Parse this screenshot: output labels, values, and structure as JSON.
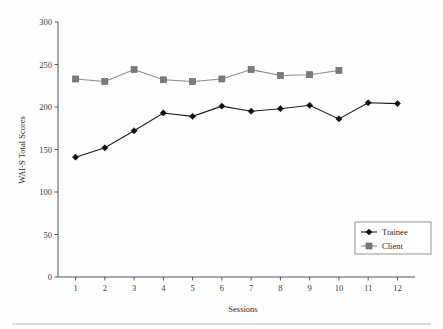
{
  "chart_data": {
    "type": "line",
    "title": "",
    "xlabel": "Sessions",
    "ylabel": "WAI-S Total Scores",
    "x": [
      1,
      2,
      3,
      4,
      5,
      6,
      7,
      8,
      9,
      10,
      11,
      12
    ],
    "xtick_labels": [
      "1",
      "2",
      "3",
      "4",
      "5",
      "6",
      "7",
      "8",
      "9",
      "10",
      "11",
      "12"
    ],
    "ytick_labels": [
      "0",
      "50",
      "100",
      "150",
      "200",
      "250",
      "300"
    ],
    "yticks": [
      0,
      50,
      100,
      150,
      200,
      250,
      300
    ],
    "ylim": [
      0,
      300
    ],
    "xlim": [
      0.4,
      12.6
    ],
    "grid": false,
    "legend_position": "lower-right",
    "series": [
      {
        "name": "Trainee",
        "marker": "diamond",
        "color": "#1c1c1c",
        "x": [
          1,
          2,
          3,
          4,
          5,
          6,
          7,
          8,
          9,
          10,
          11,
          12
        ],
        "values": [
          141,
          152,
          172,
          193,
          189,
          201,
          195,
          198,
          202,
          186,
          205,
          204
        ]
      },
      {
        "name": "Client",
        "marker": "square",
        "color": "#7a7a7a",
        "x": [
          1,
          2,
          3,
          4,
          5,
          6,
          7,
          8,
          9,
          10
        ],
        "values": [
          233,
          230,
          244,
          232,
          230,
          233,
          244,
          237,
          238,
          243
        ]
      }
    ]
  },
  "legend": {
    "entries": [
      {
        "label": "Trainee"
      },
      {
        "label": "Client"
      }
    ]
  }
}
